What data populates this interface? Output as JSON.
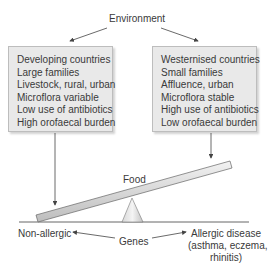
{
  "title": "Environment",
  "left_box": {
    "items": [
      "Developing countries",
      "Large families",
      "Livestock, rural, urban",
      "Microflora variable",
      "Low use of antibiotics",
      "High orofaecal burden"
    ]
  },
  "right_box": {
    "items": [
      "Westernised countries",
      "Small families",
      "Affluence, urban",
      "Microflora stable",
      "High use of antibiotics",
      "Low orofaecal burden"
    ]
  },
  "seesaw_label": "Food",
  "bottom": {
    "left_outcome": "Non-allergic",
    "center": "Genes",
    "right_outcome_line1": "Allergic disease",
    "right_outcome_line2": "(asthma, eczema,",
    "right_outcome_line3": "rhinitis)"
  },
  "colors": {
    "box_fill": "#e9e9e9",
    "plank_fill": "#cfcfcf",
    "line": "#444444"
  }
}
